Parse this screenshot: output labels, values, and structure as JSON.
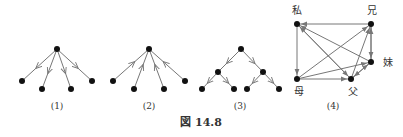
{
  "figure": {
    "caption": "図 14.8",
    "edge_color": "#777777",
    "node_color": "#111111",
    "panels": [
      {
        "label": "(1)",
        "label_pos": [
          57,
          109
        ],
        "nodes": [
          [
            57,
            49
          ],
          [
            22,
            81
          ],
          [
            42,
            89
          ],
          [
            71,
            89
          ],
          [
            92,
            81
          ]
        ],
        "edges": [
          [
            0,
            1
          ],
          [
            0,
            2
          ],
          [
            0,
            3
          ],
          [
            0,
            4
          ]
        ],
        "node_labels": []
      },
      {
        "label": "(2)",
        "label_pos": [
          149,
          109
        ],
        "nodes": [
          [
            149,
            49
          ],
          [
            113,
            81
          ],
          [
            134,
            89
          ],
          [
            164,
            89
          ],
          [
            185,
            81
          ]
        ],
        "edges": [
          [
            1,
            0
          ],
          [
            2,
            0
          ],
          [
            3,
            0
          ],
          [
            4,
            0
          ]
        ],
        "node_labels": []
      },
      {
        "label": "(3)",
        "label_pos": [
          240,
          109
        ],
        "nodes": [
          [
            241,
            49
          ],
          [
            218,
            72
          ],
          [
            263,
            72
          ],
          [
            202,
            89
          ],
          [
            234,
            89
          ],
          [
            247,
            89
          ],
          [
            279,
            89
          ]
        ],
        "edges": [
          [
            0,
            1
          ],
          [
            0,
            2
          ],
          [
            1,
            3
          ],
          [
            1,
            4
          ],
          [
            2,
            5
          ],
          [
            2,
            6
          ]
        ],
        "node_labels": []
      },
      {
        "label": "(4)",
        "label_pos": [
          333,
          109
        ],
        "nodes": [
          [
            297,
            24
          ],
          [
            371,
            24
          ],
          [
            371,
            62
          ],
          [
            297,
            79
          ],
          [
            351,
            79
          ]
        ],
        "node_labels": [
          "私",
          "兄",
          "妹",
          "母",
          "父"
        ],
        "node_label_offsets": [
          [
            -5,
            -10
          ],
          [
            -4,
            -10
          ],
          [
            12,
            4
          ],
          [
            -3,
            16
          ],
          [
            -3,
            16
          ]
        ],
        "edges": [
          [
            1,
            0
          ],
          [
            0,
            3
          ],
          [
            3,
            4
          ],
          [
            3,
            1
          ],
          [
            3,
            2
          ],
          [
            4,
            0
          ],
          [
            0,
            4
          ],
          [
            2,
            0
          ],
          [
            1,
            2
          ],
          [
            2,
            1
          ],
          [
            4,
            1
          ],
          [
            4,
            2
          ],
          [
            2,
            4
          ]
        ]
      }
    ]
  }
}
